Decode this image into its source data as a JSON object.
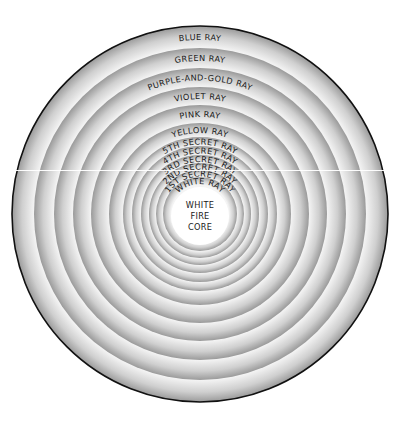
{
  "diagram": {
    "center": {
      "x": 200,
      "y": 214
    },
    "outer_border_color": "#111111",
    "ring_inner_color": "#f4f4f4",
    "ring_outer_color": "#9a9a9a",
    "rings": [
      {
        "label": "BLUE RAY",
        "r_outer": 188,
        "r_inner": 166
      },
      {
        "label": "GREEN RAY",
        "r_outer": 166,
        "r_inner": 146
      },
      {
        "label": "PURPLE-AND-GOLD RAY",
        "r_outer": 146,
        "r_inner": 127
      },
      {
        "label": "VIOLET RAY",
        "r_outer": 127,
        "r_inner": 109
      },
      {
        "label": "PINK RAY",
        "r_outer": 109,
        "r_inner": 91
      },
      {
        "label": "YELLOW RAY",
        "r_outer": 91,
        "r_inner": 77
      },
      {
        "label": "5TH SECRET RAY",
        "r_outer": 77,
        "r_inner": 68
      },
      {
        "label": "4TH SECRET RAY",
        "r_outer": 68,
        "r_inner": 59
      },
      {
        "label": "3RD SECRET RAY",
        "r_outer": 59,
        "r_inner": 51
      },
      {
        "label": "2ND SECRET RAY",
        "r_outer": 51,
        "r_inner": 44
      },
      {
        "label": "1ST SECRET RAY",
        "r_outer": 44,
        "r_inner": 37
      },
      {
        "label": "WHITE RAY",
        "r_outer": 37,
        "r_inner": 29
      }
    ],
    "core": {
      "lines": [
        "WHITE",
        "FIRE",
        "CORE"
      ],
      "radius": 29,
      "color": "#ffffff"
    }
  }
}
